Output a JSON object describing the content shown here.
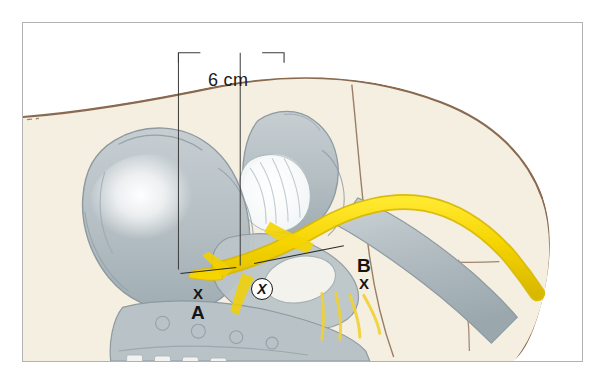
{
  "figure": {
    "measurement_label": "6 cm",
    "landmark_a_mark": "X",
    "landmark_a_label": "A",
    "landmark_b_label": "B",
    "landmark_b_mark": "X",
    "center_marker": "X"
  },
  "colors": {
    "frame_border": "#b0b2b4",
    "page_background": "#ffffff",
    "skin_outline": "#8a6a4f",
    "flesh_fill": "#f5efe2",
    "bone_fill": "#b8c2c6",
    "bone_outline": "#8d9aa0",
    "bone_highlight": "#ffffff",
    "nerve_yellow": "#f5d800",
    "nerve_yellow_shadow": "#d9bd00",
    "leader_line": "#2b2b2b",
    "label_text": "#141414"
  }
}
